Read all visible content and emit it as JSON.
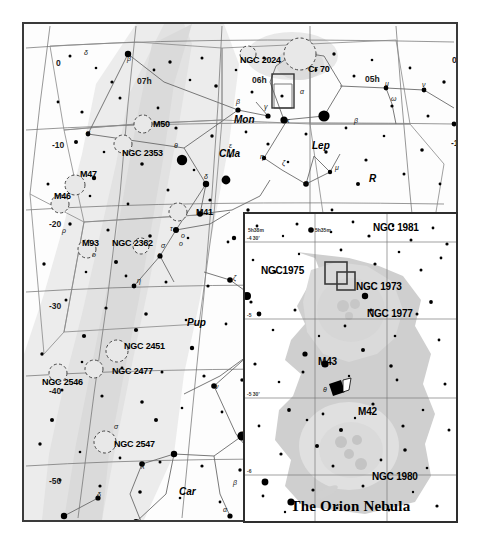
{
  "chart": {
    "kind": "star-chart",
    "title_inset": "The Orion Nebula",
    "background_color": "#fdfdfd",
    "border_color": "#3a3a3a",
    "milkyway_color": "#e6e6e6",
    "star_color": "#000000",
    "grid_color": "#6a6a6a",
    "constellation_line_color": "#555555"
  },
  "main": {
    "deep_sky_objects": [
      {
        "label": "NGC 2024",
        "x": 216,
        "y": 36
      },
      {
        "label": "Cr 70",
        "x": 284,
        "y": 45
      },
      {
        "label": "M50",
        "x": 129,
        "y": 100
      },
      {
        "label": "NGC 2353",
        "x": 98,
        "y": 129
      },
      {
        "label": "M47",
        "x": 56,
        "y": 150
      },
      {
        "label": "M46",
        "x": 30,
        "y": 172
      },
      {
        "label": "M41",
        "x": 172,
        "y": 188
      },
      {
        "label": "M93",
        "x": 58,
        "y": 219
      },
      {
        "label": "NGC 2362",
        "x": 88,
        "y": 219
      },
      {
        "label": "NGC 2451",
        "x": 100,
        "y": 322
      },
      {
        "label": "NGC 2477",
        "x": 88,
        "y": 347
      },
      {
        "label": "NGC 2546",
        "x": 18,
        "y": 358
      },
      {
        "label": "NGC 2547",
        "x": 90,
        "y": 420
      }
    ],
    "constellations": [
      {
        "label": "Mon",
        "x": 210,
        "y": 96
      },
      {
        "label": "CMa",
        "x": 195,
        "y": 130
      },
      {
        "label": "Lep",
        "x": 288,
        "y": 122
      },
      {
        "label": "R",
        "x": 345,
        "y": 155
      },
      {
        "label": "Pup",
        "x": 163,
        "y": 299
      },
      {
        "label": "Car",
        "x": 155,
        "y": 468
      }
    ],
    "ra_labels": [
      {
        "label": "07h",
        "x": 113,
        "y": 58
      },
      {
        "label": "06h",
        "x": 228,
        "y": 57
      },
      {
        "label": "05h",
        "x": 341,
        "y": 56
      }
    ],
    "dec_labels_left": [
      {
        "label": "0",
        "x": 32,
        "y": 40
      },
      {
        "label": "-10",
        "x": 28,
        "y": 122
      },
      {
        "label": "-20",
        "x": 25,
        "y": 201
      },
      {
        "label": "-30",
        "x": 25,
        "y": 283
      },
      {
        "label": "-40",
        "x": 25,
        "y": 368
      },
      {
        "label": "-50",
        "x": 25,
        "y": 458
      }
    ],
    "dec_labels_right": [
      {
        "label": "0",
        "x": 428,
        "y": 37
      },
      {
        "label": "-10",
        "x": 427,
        "y": 120
      },
      {
        "label": "-20",
        "x": 419,
        "y": 194
      }
    ],
    "greek_star_labels": [
      {
        "label": "δ",
        "sup": "1",
        "x": 60,
        "y": 30
      },
      {
        "label": "β",
        "sup": "",
        "x": 103,
        "y": 36
      },
      {
        "label": "α",
        "sup": "",
        "x": 62,
        "y": 110
      },
      {
        "label": "β",
        "sup": "",
        "x": 212,
        "y": 79
      },
      {
        "label": "γ",
        "sup": "",
        "x": 240,
        "y": 84
      },
      {
        "label": "ε",
        "sup": "",
        "x": 205,
        "y": 123
      },
      {
        "label": "θ",
        "sup": "",
        "x": 150,
        "y": 123
      },
      {
        "label": "β",
        "sup": "",
        "x": 330,
        "y": 98
      },
      {
        "label": "α",
        "sup": "",
        "x": 276,
        "y": 69
      },
      {
        "label": "κ",
        "sup": "",
        "x": 262,
        "y": 98
      },
      {
        "label": "η",
        "sup": "",
        "x": 236,
        "y": 134
      },
      {
        "label": "ζ",
        "sup": "",
        "x": 258,
        "y": 140
      },
      {
        "label": "α",
        "sup": "",
        "x": 280,
        "y": 160
      },
      {
        "label": "μ",
        "sup": "",
        "x": 311,
        "y": 145
      },
      {
        "label": "μ",
        "sup": "",
        "x": 361,
        "y": 61
      },
      {
        "label": "ν",
        "sup": "",
        "x": 398,
        "y": 62
      },
      {
        "label": "ω",
        "sup": "",
        "x": 367,
        "y": 76
      },
      {
        "label": "ε",
        "sup": "",
        "x": 439,
        "y": 69
      },
      {
        "label": "ε",
        "sup": "",
        "x": 436,
        "y": 100
      },
      {
        "label": "ο",
        "sup": "1",
        "x": 448,
        "y": 96
      },
      {
        "label": "ο",
        "sup": "2",
        "x": 445,
        "y": 106
      },
      {
        "label": "δ",
        "sup": "",
        "x": 180,
        "y": 154
      },
      {
        "label": "σ",
        "sup": "",
        "x": 137,
        "y": 223
      },
      {
        "label": "τ",
        "sup": "",
        "x": 146,
        "y": 206
      },
      {
        "label": "ε",
        "sup": "",
        "x": 134,
        "y": 232
      },
      {
        "label": "ο",
        "sup": "1",
        "x": 155,
        "y": 221
      },
      {
        "label": "ο",
        "sup": "2",
        "x": 157,
        "y": 213
      },
      {
        "label": "η",
        "sup": "",
        "x": 113,
        "y": 258
      },
      {
        "label": "ζ",
        "sup": "",
        "x": 209,
        "y": 255
      },
      {
        "label": "ζ",
        "sup": "",
        "x": 238,
        "y": 276
      },
      {
        "label": "π",
        "sup": "2",
        "x": 226,
        "y": 333
      },
      {
        "label": "π",
        "sup": "1",
        "x": 226,
        "y": 349
      },
      {
        "label": "ν",
        "sup": "",
        "x": 191,
        "y": 364
      },
      {
        "label": "α",
        "sup": "",
        "x": 218,
        "y": 410
      },
      {
        "label": "δ",
        "sup": "",
        "x": 231,
        "y": 430
      },
      {
        "label": "β",
        "sup": "",
        "x": 209,
        "y": 460
      },
      {
        "label": "α",
        "sup": "",
        "x": 199,
        "y": 487
      },
      {
        "label": "η",
        "sup": "2",
        "x": 234,
        "y": 514
      },
      {
        "label": "χ",
        "sup": "",
        "x": 117,
        "y": 442
      },
      {
        "label": "ε",
        "sup": "",
        "x": 113,
        "y": 500
      },
      {
        "label": "δ",
        "sup": "",
        "x": 73,
        "y": 472
      },
      {
        "label": "σ",
        "sup": "2",
        "x": 90,
        "y": 404
      },
      {
        "label": "ρ",
        "sup": "",
        "x": 38,
        "y": 208
      },
      {
        "label": "ο",
        "sup": "",
        "x": 68,
        "y": 232
      }
    ]
  },
  "inset": {
    "title": "The Orion Nebula",
    "deep_sky_objects": [
      {
        "label": "NGC 1981",
        "x": 128,
        "y": 14
      },
      {
        "label": "NGC1975",
        "x": 42,
        "y": 57
      },
      {
        "label": "NGC 1973",
        "x": 117,
        "y": 73
      },
      {
        "label": "NGC 1977",
        "x": 128,
        "y": 100
      },
      {
        "label": "M43",
        "x": 79,
        "y": 148
      },
      {
        "label": "M42",
        "x": 119,
        "y": 198
      },
      {
        "label": "NGC 1980",
        "x": 133,
        "y": 263
      }
    ],
    "ra_labels": [
      {
        "label": "5h38m",
        "x": 3,
        "y": 16
      },
      {
        "label": "5h35m",
        "x": 70,
        "y": 16
      }
    ],
    "dec_labels": [
      {
        "label": "-4 30'",
        "x": 2,
        "y": 24
      },
      {
        "label": "-5",
        "x": 2,
        "y": 101
      },
      {
        "label": "-5 30'",
        "x": 2,
        "y": 180
      },
      {
        "label": "-6",
        "x": 2,
        "y": 257
      }
    ],
    "star_labels": [
      {
        "label": "θ",
        "sup": "1",
        "x": 78,
        "y": 178
      }
    ]
  }
}
